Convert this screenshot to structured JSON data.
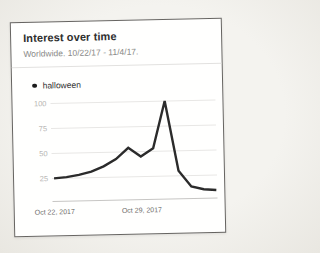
{
  "card": {
    "title": "Interest over time",
    "subtitle": "Worldwide. 10/22/17 - 11/4/17.",
    "legend": [
      {
        "label": "halloween"
      }
    ]
  },
  "chart_data": {
    "type": "line",
    "title": "Interest over time",
    "subtitle": "Worldwide. 10/22/17 - 11/4/17.",
    "x": [
      "Oct 22, 2017",
      "Oct 23, 2017",
      "Oct 24, 2017",
      "Oct 25, 2017",
      "Oct 26, 2017",
      "Oct 27, 2017",
      "Oct 28, 2017",
      "Oct 29, 2017",
      "Oct 30, 2017",
      "Oct 31, 2017",
      "Nov 1, 2017",
      "Nov 2, 2017",
      "Nov 3, 2017",
      "Nov 4, 2017"
    ],
    "series": [
      {
        "name": "halloween",
        "values": [
          25,
          26,
          28,
          31,
          36,
          43,
          54,
          45,
          53,
          100,
          30,
          14,
          11,
          10
        ]
      }
    ],
    "y_ticks": [
      25,
      50,
      75,
      100
    ],
    "x_ticks": [
      {
        "label": "Oct 22, 2017",
        "index": 0
      },
      {
        "label": "Oct 29, 2017",
        "index": 7
      }
    ],
    "ylim": [
      0,
      100
    ],
    "grid": true,
    "legend_position": "top-left"
  },
  "colors": {
    "line": "#2b2b2b",
    "grid": "#e8e7e5",
    "axis": "#c7c6c4",
    "y_tick_label": "#b6b5b3",
    "x_tick_label": "#6e6d6b",
    "legend_dot": "#1c1c1c"
  }
}
